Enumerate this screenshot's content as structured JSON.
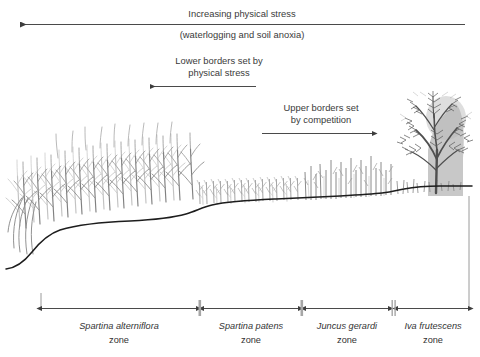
{
  "figure": {
    "title_top": "Increasing physical stress",
    "subtitle_top": "(waterlogging and soil anoxia)",
    "annotations": [
      {
        "id": "lower-borders",
        "line1": "Lower borders set by",
        "line2": "physical stress",
        "arrow_direction": "left"
      },
      {
        "id": "upper-borders",
        "line1": "Upper borders set",
        "line2": "by competition",
        "arrow_direction": "right"
      }
    ],
    "top_arrow": {
      "direction": "left",
      "x_start": 465,
      "x_end": 20,
      "y": 24
    },
    "zones": [
      {
        "id": "spartina-alterniflora",
        "species": "Spartina alterniflora",
        "suffix": "zone",
        "x_start": 42,
        "x_end": 196,
        "label_x": 119
      },
      {
        "id": "spartina-patens",
        "species": "Spartina patens",
        "suffix": "zone",
        "x_start": 204,
        "x_end": 298,
        "label_x": 251
      },
      {
        "id": "juncus-gerardi",
        "species": "Juncus gerardi",
        "suffix": "zone",
        "x_start": 306,
        "x_end": 388,
        "label_x": 347
      },
      {
        "id": "iva-frutescens",
        "species": "Iva frutescens",
        "suffix": "zone",
        "x_start": 398,
        "x_end": 468,
        "label_x": 433
      }
    ],
    "separators": [
      200,
      302,
      393
    ],
    "colors": {
      "ink": "#231f20",
      "text": "#3a3a3a",
      "axis": "#4a4a4a",
      "ground": "#1d1d1d",
      "vegetation_dark": "#6e6e6e",
      "vegetation_light": "#b9b9b9",
      "shadow": "#b5b5b5",
      "background": "#ffffff"
    }
  }
}
